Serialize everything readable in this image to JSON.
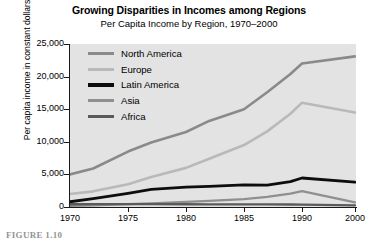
{
  "figure": {
    "title": "Growing Disparities in Incomes among Regions",
    "subtitle": "Per Capita Income by Region, 1970–2000",
    "caption": "FIGURE 1.10",
    "axis_break_glyph": "//"
  },
  "chart_data": {
    "type": "line",
    "title": "Growing Disparities in Incomes among Regions",
    "subtitle": "Per Capita Income by Region, 1970–2000",
    "xlabel": "",
    "ylabel": "Per capita income in constant dollars",
    "x": [
      1970,
      1972,
      1975,
      1977,
      1980,
      1982,
      1985,
      1987,
      1989,
      1990,
      2000
    ],
    "xticks": [
      1970,
      1975,
      1980,
      1985,
      1990,
      2000
    ],
    "xticklabels": [
      "1970",
      "1975",
      "1980",
      "1985",
      "1990",
      "2000"
    ],
    "xlim": [
      1970,
      2000
    ],
    "yticks": [
      0,
      5000,
      10000,
      15000,
      20000,
      25000
    ],
    "yticklabels": [
      "0",
      "5,000",
      "10,000",
      "15,000",
      "20,000",
      "25,000"
    ],
    "ylim": [
      0,
      25000
    ],
    "grid": false,
    "axis_break_between": [
      1990,
      2000
    ],
    "legend_position": "upper-left-inside",
    "series": [
      {
        "name": "North America",
        "color": "#8a8a8a",
        "width": 2.6,
        "values": [
          5000,
          5900,
          8500,
          9900,
          11500,
          13200,
          15000,
          17600,
          20400,
          22000,
          23100
        ]
      },
      {
        "name": "Europe",
        "color": "#b9b9b9",
        "width": 2.6,
        "values": [
          2000,
          2400,
          3500,
          4600,
          6000,
          7400,
          9500,
          11600,
          14300,
          16000,
          14500
        ]
      },
      {
        "name": "Latin America",
        "color": "#0d0d0d",
        "width": 2.8,
        "values": [
          800,
          1300,
          2100,
          2700,
          3050,
          3150,
          3400,
          3350,
          3900,
          4450,
          3800
        ]
      },
      {
        "name": "Asia",
        "color": "#8f8f8f",
        "width": 2.3,
        "values": [
          180,
          260,
          430,
          560,
          780,
          950,
          1200,
          1550,
          2050,
          2450,
          700
        ]
      },
      {
        "name": "Africa",
        "color": "#5a5a5a",
        "width": 2.3,
        "values": [
          420,
          430,
          440,
          430,
          420,
          410,
          400,
          390,
          380,
          370,
          260
        ]
      }
    ]
  },
  "legend": {
    "items": [
      {
        "label": "North America",
        "color": "#8a8a8a"
      },
      {
        "label": "Europe",
        "color": "#b9b9b9"
      },
      {
        "label": "Latin America",
        "color": "#0d0d0d"
      },
      {
        "label": "Asia",
        "color": "#8f8f8f"
      },
      {
        "label": "Africa",
        "color": "#5a5a5a"
      }
    ]
  }
}
